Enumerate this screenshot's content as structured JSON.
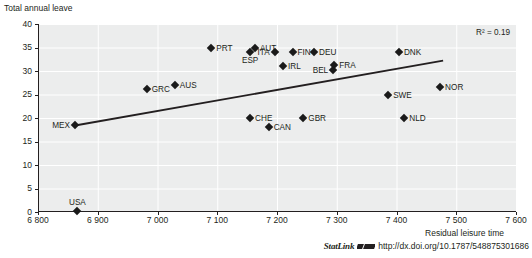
{
  "chart_data": {
    "type": "scatter",
    "title": "",
    "xlabel": "Residual leisure time",
    "ylabel": "Total annual leave",
    "xlim": [
      6800,
      7600
    ],
    "ylim": [
      0,
      40
    ],
    "xticks": [
      "6 800",
      "6 900",
      "7 000",
      "7 100",
      "7 200",
      "7 300",
      "7 400",
      "7 500",
      "7 600"
    ],
    "xtick_values": [
      6800,
      6900,
      7000,
      7100,
      7200,
      7300,
      7400,
      7500,
      7600
    ],
    "yticks": [
      "0",
      "5",
      "10",
      "15",
      "20",
      "25",
      "30",
      "35",
      "40"
    ],
    "ytick_values": [
      0,
      5,
      10,
      15,
      20,
      25,
      30,
      35,
      40
    ],
    "grid": true,
    "legend": "none",
    "annotation": "R² = 0.19",
    "r_squared": 0.19,
    "trendline": {
      "type": "linear",
      "x0": 6862,
      "y0": 18.4,
      "x1": 7478,
      "y1": 32.2
    },
    "points": [
      {
        "label": "MEX",
        "x": 6862,
        "y": 18.5,
        "label_pos": "left"
      },
      {
        "label": "USA",
        "x": 6866,
        "y": 0.2,
        "label_pos": "above"
      },
      {
        "label": "GRC",
        "x": 6982,
        "y": 26.1,
        "label_pos": "right"
      },
      {
        "label": "AUS",
        "x": 7029,
        "y": 27.0,
        "label_pos": "right"
      },
      {
        "label": "PRT",
        "x": 7090,
        "y": 35.0,
        "label_pos": "right"
      },
      {
        "label": "ESP",
        "x": 7155,
        "y": 34.0,
        "label_pos": "below"
      },
      {
        "label": "AUT",
        "x": 7163,
        "y": 35.0,
        "label_pos": "right"
      },
      {
        "label": "CHE",
        "x": 7155,
        "y": 20.0,
        "label_pos": "right"
      },
      {
        "label": "ITA",
        "x": 7196,
        "y": 34.0,
        "label_pos": "left"
      },
      {
        "label": "CAN",
        "x": 7186,
        "y": 18.0,
        "label_pos": "right"
      },
      {
        "label": "IRL",
        "x": 7210,
        "y": 31.0,
        "label_pos": "right"
      },
      {
        "label": "FIN",
        "x": 7226,
        "y": 34.1,
        "label_pos": "right"
      },
      {
        "label": "GBR",
        "x": 7244,
        "y": 20.0,
        "label_pos": "right"
      },
      {
        "label": "DEU",
        "x": 7262,
        "y": 34.1,
        "label_pos": "right"
      },
      {
        "label": "BEL",
        "x": 7294,
        "y": 30.3,
        "label_pos": "left"
      },
      {
        "label": "FRA",
        "x": 7296,
        "y": 31.3,
        "label_pos": "right"
      },
      {
        "label": "SWE",
        "x": 7386,
        "y": 25.0,
        "label_pos": "right"
      },
      {
        "label": "DNK",
        "x": 7404,
        "y": 34.0,
        "label_pos": "right"
      },
      {
        "label": "NLD",
        "x": 7413,
        "y": 20.0,
        "label_pos": "right"
      },
      {
        "label": "NOR",
        "x": 7473,
        "y": 26.7,
        "label_pos": "right"
      }
    ]
  },
  "footer": {
    "statlink_word": "StatLink",
    "statlink_icon": "statlink-arrow-icon",
    "url": "http://dx.doi.org/10.1787/548875301686"
  }
}
